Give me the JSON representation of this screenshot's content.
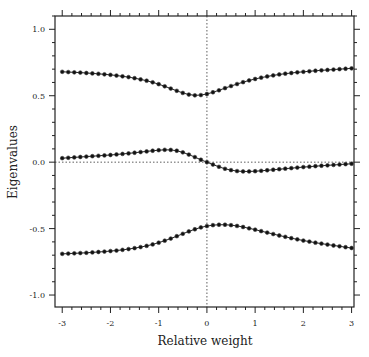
{
  "chart_data": {
    "type": "scatter",
    "title": "",
    "xlabel": "Relative weight",
    "ylabel": "Eigenvalues",
    "xlim": [
      -3.15,
      3.05
    ],
    "ylim": [
      -1.09,
      1.1
    ],
    "grid": false,
    "legend": null,
    "xticks": [
      -3,
      -2,
      -1,
      0,
      1,
      2,
      3
    ],
    "xtick_labels": [
      "-3",
      "-2",
      "-1",
      "0",
      "1",
      "2",
      "3"
    ],
    "yticks": [
      -1.0,
      -0.5,
      0.0,
      0.5,
      1.0
    ],
    "ytick_labels": [
      "-1.0",
      "-0.5",
      "0.0",
      "0.5",
      "1.0"
    ],
    "reference_lines": [
      {
        "axis": "x",
        "value": 0,
        "style": "dotted"
      },
      {
        "axis": "y",
        "value": 0,
        "style": "dotted"
      }
    ],
    "x": [
      -3,
      -2.875,
      -2.75,
      -2.625,
      -2.5,
      -2.375,
      -2.25,
      -2.125,
      -2,
      -1.875,
      -1.75,
      -1.625,
      -1.5,
      -1.375,
      -1.25,
      -1.125,
      -1,
      -0.875,
      -0.75,
      -0.625,
      -0.5,
      -0.375,
      -0.25,
      -0.125,
      0,
      0.125,
      0.25,
      0.375,
      0.5,
      0.625,
      0.75,
      0.875,
      1,
      1.125,
      1.25,
      1.375,
      1.5,
      1.625,
      1.75,
      1.875,
      2,
      2.125,
      2.25,
      2.375,
      2.5,
      2.625,
      2.75,
      2.875,
      3
    ],
    "series": [
      {
        "name": "eigenvalue-1",
        "values": [
          0.68,
          0.678,
          0.676,
          0.674,
          0.671,
          0.668,
          0.665,
          0.661,
          0.657,
          0.652,
          0.646,
          0.64,
          0.632,
          0.623,
          0.613,
          0.601,
          0.587,
          0.571,
          0.554,
          0.537,
          0.521,
          0.509,
          0.503,
          0.505,
          0.513,
          0.526,
          0.541,
          0.557,
          0.573,
          0.588,
          0.602,
          0.615,
          0.626,
          0.636,
          0.645,
          0.653,
          0.66,
          0.666,
          0.671,
          0.676,
          0.68,
          0.684,
          0.688,
          0.691,
          0.694,
          0.697,
          0.7,
          0.703,
          0.706
        ]
      },
      {
        "name": "eigenvalue-2",
        "values": [
          0.03,
          0.033,
          0.036,
          0.039,
          0.042,
          0.045,
          0.048,
          0.051,
          0.054,
          0.058,
          0.062,
          0.066,
          0.071,
          0.076,
          0.081,
          0.086,
          0.09,
          0.093,
          0.092,
          0.086,
          0.074,
          0.057,
          0.038,
          0.018,
          0.0,
          -0.018,
          -0.035,
          -0.05,
          -0.06,
          -0.067,
          -0.07,
          -0.07,
          -0.068,
          -0.065,
          -0.061,
          -0.057,
          -0.053,
          -0.049,
          -0.045,
          -0.041,
          -0.037,
          -0.034,
          -0.03,
          -0.027,
          -0.024,
          -0.021,
          -0.018,
          -0.015,
          -0.012
        ]
      },
      {
        "name": "eigenvalue-3",
        "values": [
          -0.69,
          -0.688,
          -0.686,
          -0.684,
          -0.682,
          -0.679,
          -0.676,
          -0.673,
          -0.669,
          -0.665,
          -0.66,
          -0.654,
          -0.647,
          -0.639,
          -0.63,
          -0.619,
          -0.606,
          -0.591,
          -0.575,
          -0.557,
          -0.539,
          -0.521,
          -0.505,
          -0.491,
          -0.481,
          -0.474,
          -0.471,
          -0.471,
          -0.474,
          -0.48,
          -0.488,
          -0.498,
          -0.508,
          -0.519,
          -0.53,
          -0.541,
          -0.552,
          -0.562,
          -0.572,
          -0.581,
          -0.59,
          -0.598,
          -0.606,
          -0.613,
          -0.62,
          -0.627,
          -0.633,
          -0.64,
          -0.646
        ]
      }
    ]
  }
}
